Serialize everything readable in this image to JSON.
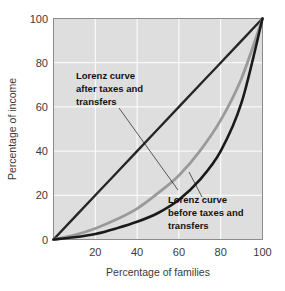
{
  "chart_data": {
    "type": "line",
    "title": "",
    "xlabel": "Percentage of families",
    "ylabel": "Percentage of income",
    "xlim": [
      0,
      100
    ],
    "ylim": [
      0,
      100
    ],
    "xticks": [
      20,
      40,
      60,
      80,
      100
    ],
    "yticks": [
      0,
      20,
      40,
      60,
      80,
      100
    ],
    "grid": true,
    "legend_position": "annotations-inline",
    "series": [
      {
        "name": "Line of equality",
        "color": "#262626",
        "x": [
          0,
          10,
          20,
          30,
          40,
          50,
          60,
          70,
          80,
          90,
          100
        ],
        "values": [
          0,
          10,
          20,
          30,
          40,
          50,
          60,
          70,
          80,
          90,
          100
        ]
      },
      {
        "name": "Lorenz curve after taxes and transfers",
        "color": "#9a9a9a",
        "x": [
          0,
          10,
          20,
          30,
          40,
          50,
          60,
          70,
          80,
          90,
          100
        ],
        "values": [
          0,
          2,
          5,
          9,
          14,
          21,
          29,
          40,
          54,
          73,
          100
        ]
      },
      {
        "name": "Lorenz curve before taxes and transfers",
        "color": "#1a1a1a",
        "x": [
          0,
          10,
          20,
          30,
          40,
          50,
          60,
          70,
          80,
          90,
          100
        ],
        "values": [
          0,
          1,
          2.5,
          5,
          8,
          12,
          18,
          27,
          40,
          62,
          100
        ]
      }
    ],
    "annotations": [
      {
        "id": "after-taxes",
        "lines": [
          "Lorenz curve",
          "after taxes and",
          "transfers"
        ],
        "text_x": 76,
        "text_y": 79,
        "leader_from_x": 119,
        "leader_from_y": 108,
        "leader_to_x": 178,
        "leader_to_y": 190
      },
      {
        "id": "before-taxes",
        "lines": [
          "Lorenz curve",
          "before taxes and",
          "transfers"
        ],
        "text_x": 168,
        "text_y": 203,
        "leader_from_x": 189,
        "leader_from_y": 172,
        "leader_to_x": 202,
        "leader_to_y": 197
      }
    ]
  },
  "axes": {
    "x_tick_labels": [
      "20",
      "40",
      "60",
      "80",
      "100"
    ],
    "y_tick_labels": [
      "0",
      "20",
      "40",
      "60",
      "80",
      "100"
    ],
    "x_axis_title": "Percentage of families",
    "y_axis_title": "Percentage of income"
  },
  "colors": {
    "plot_background": "#dedede",
    "gridline": "#ffffff",
    "plot_border": "#8c8c8c",
    "equality_line": "#262626",
    "after_taxes_curve": "#9a9a9a",
    "before_taxes_curve": "#1a1a1a",
    "tick_text": "#3a3a3a",
    "annotation_text": "#14120f",
    "page_background": "#ffffff"
  }
}
